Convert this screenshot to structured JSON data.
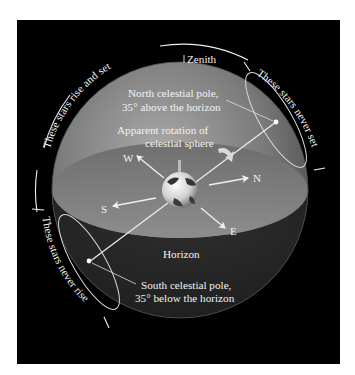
{
  "figure": {
    "background_color": "#000000",
    "page_color": "#ffffff",
    "sphere_color": "#8a8a8a",
    "line_color": "#e8e8e8"
  },
  "labels": {
    "zenith": "Zenith",
    "north_pole_line1": "North celestial pole,",
    "north_pole_line2": "35° above the horizon",
    "rotation_line1": "Apparent rotation of",
    "rotation_line2": "celestial sphere",
    "horizon": "Horizon",
    "south_pole_line1": "South celestial pole,",
    "south_pole_line2": "35° below the horizon"
  },
  "directions": {
    "north": "N",
    "south": "S",
    "east": "E",
    "west": "W"
  },
  "arc_labels": {
    "rise_and_set": "These stars rise and set",
    "never_set": "These stars never set",
    "never_rise": "These stars never rise"
  }
}
